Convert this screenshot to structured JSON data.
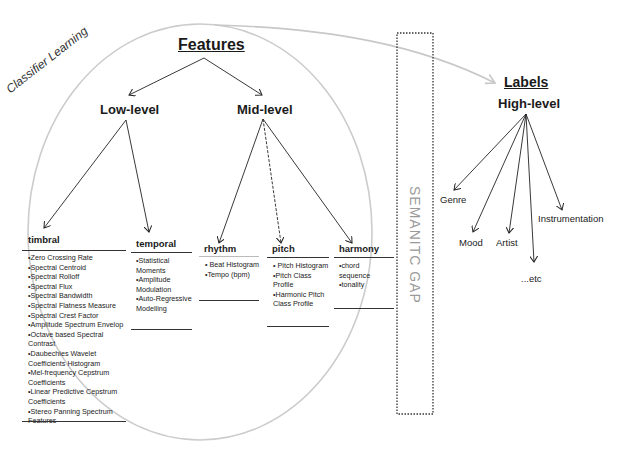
{
  "diagram": {
    "classifier_label": "Classifier Learning",
    "semantic_gap_label": "SEMANITC GAP",
    "features": {
      "title": "Features",
      "low_level": {
        "label": "Low-level",
        "categories": [
          {
            "name": "timbral",
            "items": [
              "•Zero Crossing Rate",
              "•Spectral Centroid",
              "•Spectral Rolloff",
              "•Spectral Flux",
              "•Spectral Bandwidth",
              "•Spectral Flatness Measure",
              "•Spectral Crest Factor",
              "•Amplitude Spectrum Envelop",
              "•Octave based Spectral Contrast",
              "•Daubechies Wavelet Coefficients Histogram",
              "•Mel-frequency Cepstrum Coefficients",
              "•Linear Predictive Cepstrum Coefficients",
              "•Stereo Panning Spectrum Features"
            ]
          },
          {
            "name": "temporal",
            "items": [
              "•Statistical Moments",
              "•Amplitude Modulation",
              "•Auto-Regressive Modelling"
            ]
          }
        ]
      },
      "mid_level": {
        "label": "Mid-level",
        "categories": [
          {
            "name": "rhythm",
            "items": [
              "• Beat Histogram",
              "•Tempo (bpm)"
            ]
          },
          {
            "name": "pitch",
            "items": [
              "• Pitch Histogram",
              "•Pitch Class Profile",
              "•Harmonic Pitch Class Profile"
            ]
          },
          {
            "name": "harmony",
            "items": [
              "•chord sequence",
              "•tonality"
            ]
          }
        ]
      }
    },
    "labels": {
      "title": "Labels",
      "high_level": {
        "label": "High-level",
        "items": [
          "Genre",
          "Mood",
          "Artist",
          "...etc",
          "Instrumentation"
        ]
      }
    },
    "colors": {
      "ink": "#1a1a1a",
      "circle": "#c8c8c8",
      "gap_text": "#9a9a9a",
      "dotted_box": "#333333"
    }
  }
}
